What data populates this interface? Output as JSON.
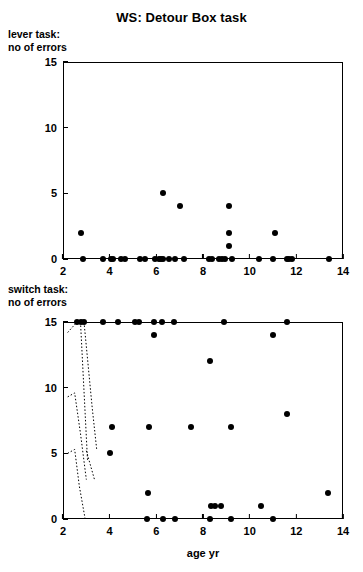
{
  "title": "WS: Detour Box task",
  "axis": {
    "x_min": 2,
    "x_max": 14,
    "x_ticks": [
      "2",
      "4",
      "6",
      "8",
      "10",
      "12",
      "14"
    ],
    "y_min": 0,
    "y_max": 15,
    "y_ticks": [
      "0",
      "5",
      "10",
      "15"
    ],
    "xlabel": "age yr"
  },
  "panels": {
    "upper": {
      "caption": "lever task:\nno of errors"
    },
    "lower": {
      "caption": "switch task:\nno of errors"
    }
  },
  "chart_data": [
    {
      "type": "scatter",
      "title": "WS: Detour Box task",
      "subtitle": "lever task: no of errors",
      "xlabel": "",
      "ylabel": "no of errors",
      "xlim": [
        2,
        14
      ],
      "ylim": [
        0,
        15
      ],
      "xticks": [
        2,
        4,
        6,
        8,
        10,
        12,
        14
      ],
      "yticks": [
        0,
        5,
        10,
        15
      ],
      "grid": false,
      "legend": "none",
      "marker": "filled-circle",
      "points": [
        {
          "x": 2.75,
          "y": 2
        },
        {
          "x": 2.85,
          "y": 0
        },
        {
          "x": 3.7,
          "y": 0
        },
        {
          "x": 4.05,
          "y": 0
        },
        {
          "x": 4.15,
          "y": 0
        },
        {
          "x": 4.5,
          "y": 0
        },
        {
          "x": 4.65,
          "y": 0
        },
        {
          "x": 5.3,
          "y": 0
        },
        {
          "x": 5.5,
          "y": 0
        },
        {
          "x": 5.95,
          "y": 0
        },
        {
          "x": 6.1,
          "y": 0
        },
        {
          "x": 6.2,
          "y": 0
        },
        {
          "x": 6.3,
          "y": 0
        },
        {
          "x": 6.3,
          "y": 5
        },
        {
          "x": 6.55,
          "y": 0
        },
        {
          "x": 6.8,
          "y": 0
        },
        {
          "x": 7.0,
          "y": 4
        },
        {
          "x": 7.2,
          "y": 0
        },
        {
          "x": 8.25,
          "y": 0
        },
        {
          "x": 8.4,
          "y": 0
        },
        {
          "x": 8.7,
          "y": 0
        },
        {
          "x": 8.8,
          "y": 0
        },
        {
          "x": 8.95,
          "y": 0
        },
        {
          "x": 9.1,
          "y": 1
        },
        {
          "x": 9.1,
          "y": 2
        },
        {
          "x": 9.1,
          "y": 4
        },
        {
          "x": 9.25,
          "y": 0
        },
        {
          "x": 10.4,
          "y": 0
        },
        {
          "x": 11.0,
          "y": 0
        },
        {
          "x": 11.1,
          "y": 2
        },
        {
          "x": 11.6,
          "y": 0
        },
        {
          "x": 11.7,
          "y": 0
        },
        {
          "x": 11.8,
          "y": 0
        },
        {
          "x": 13.4,
          "y": 0
        }
      ]
    },
    {
      "type": "scatter",
      "title": "",
      "subtitle": "switch task: no of errors",
      "xlabel": "age yr",
      "ylabel": "no of errors",
      "xlim": [
        2,
        14
      ],
      "ylim": [
        0,
        15
      ],
      "xticks": [
        2,
        4,
        6,
        8,
        10,
        12,
        14
      ],
      "yticks": [
        0,
        5,
        10,
        15
      ],
      "grid": false,
      "legend": "none",
      "marker": "filled-circle",
      "points": [
        {
          "x": 2.6,
          "y": 15
        },
        {
          "x": 2.75,
          "y": 15
        },
        {
          "x": 2.9,
          "y": 15
        },
        {
          "x": 3.7,
          "y": 15
        },
        {
          "x": 4.35,
          "y": 15
        },
        {
          "x": 4.1,
          "y": 7
        },
        {
          "x": 4.0,
          "y": 5
        },
        {
          "x": 5.1,
          "y": 15
        },
        {
          "x": 5.25,
          "y": 15
        },
        {
          "x": 5.9,
          "y": 15
        },
        {
          "x": 5.9,
          "y": 14
        },
        {
          "x": 5.7,
          "y": 7
        },
        {
          "x": 5.65,
          "y": 2
        },
        {
          "x": 5.6,
          "y": 0
        },
        {
          "x": 6.25,
          "y": 15
        },
        {
          "x": 6.3,
          "y": 0
        },
        {
          "x": 6.75,
          "y": 15
        },
        {
          "x": 6.8,
          "y": 0
        },
        {
          "x": 7.5,
          "y": 7
        },
        {
          "x": 8.3,
          "y": 12
        },
        {
          "x": 8.35,
          "y": 1
        },
        {
          "x": 8.3,
          "y": 0
        },
        {
          "x": 8.5,
          "y": 1
        },
        {
          "x": 8.75,
          "y": 1
        },
        {
          "x": 8.9,
          "y": 15
        },
        {
          "x": 9.2,
          "y": 7
        },
        {
          "x": 9.2,
          "y": 0
        },
        {
          "x": 10.5,
          "y": 1
        },
        {
          "x": 11.0,
          "y": 14
        },
        {
          "x": 11.0,
          "y": 0
        },
        {
          "x": 11.6,
          "y": 15
        },
        {
          "x": 11.6,
          "y": 8
        },
        {
          "x": 13.35,
          "y": 2
        }
      ],
      "dotted_traces": [
        {
          "name": "trace-1",
          "points": [
            [
              2.2,
              14.2
            ],
            [
              2.6,
              15
            ]
          ]
        },
        {
          "name": "trace-2",
          "points": [
            [
              2.75,
              15
            ],
            [
              2.95,
              8.0
            ],
            [
              3.05,
              4.5
            ]
          ]
        },
        {
          "name": "trace-3",
          "points": [
            [
              2.9,
              15
            ],
            [
              3.25,
              8.5
            ],
            [
              3.45,
              5.2
            ]
          ]
        },
        {
          "name": "trace-4",
          "points": [
            [
              2.2,
              9.3
            ],
            [
              2.5,
              9.6
            ],
            [
              2.75,
              6.5
            ],
            [
              3.0,
              3.0
            ]
          ]
        },
        {
          "name": "trace-5",
          "points": [
            [
              2.2,
              5.0
            ],
            [
              2.5,
              5.3
            ],
            [
              2.7,
              2.5
            ],
            [
              2.95,
              0.0
            ]
          ]
        },
        {
          "name": "trace-6",
          "points": [
            [
              3.0,
              5.2
            ],
            [
              3.35,
              3.0
            ]
          ]
        }
      ]
    }
  ]
}
